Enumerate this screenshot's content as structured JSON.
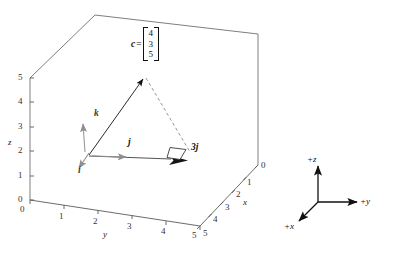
{
  "figure": {
    "title_hidden": "",
    "vector_label": {
      "name": "c",
      "equals": "=",
      "components": [
        "4",
        "3",
        "5"
      ]
    },
    "basis_vectors": [
      {
        "name": "i",
        "label": "i"
      },
      {
        "name": "j",
        "label": "j"
      },
      {
        "name": "k",
        "label": "k"
      }
    ],
    "scaled_vector_label": "3j",
    "axes": {
      "z": {
        "label": "z",
        "ticks": [
          "0",
          "1",
          "2",
          "3",
          "4",
          "5"
        ]
      },
      "y": {
        "label": "y",
        "ticks": [
          "0",
          "1",
          "2",
          "3",
          "4",
          "5"
        ]
      },
      "x": {
        "label": "x",
        "ticks": [
          "0",
          "1",
          "2",
          "3",
          "4",
          "5"
        ]
      }
    },
    "origin_tick": "0"
  },
  "triad": {
    "z_label": "+z",
    "y_label": "+y",
    "x_label": "+x"
  },
  "colors": {
    "line": "#555555",
    "box": "#6b6b6b",
    "vector": "#1a1a1a",
    "basis": "#8c8c8c",
    "text": "#111111",
    "background": "#ffffff"
  }
}
